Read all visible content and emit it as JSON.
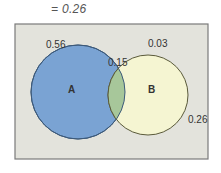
{
  "header": {
    "equation": "= 0.26"
  },
  "venn": {
    "colors": {
      "background": "#e3e3dc",
      "border": "#7a7a7a",
      "circle_a": "#7aa3d3",
      "circle_b": "#f5f5d2",
      "overlap": "#a7c79a"
    },
    "sets": [
      {
        "name": "A",
        "only_value": "0.56"
      },
      {
        "name": "B",
        "only_value": "0.03"
      }
    ],
    "intersection_value": "0.15",
    "outside_value": "0.26"
  }
}
